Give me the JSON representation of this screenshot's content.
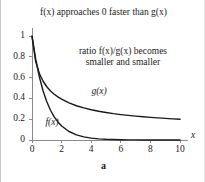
{
  "figure": {
    "caption": "a",
    "width": 205,
    "height": 182,
    "background": "#ffffff",
    "curve_color": "#1a1a1a",
    "axis_color": "#8a8a8a"
  },
  "chart_data": {
    "type": "line",
    "title": "f(x) approaches 0 faster than g(x)",
    "xlabel": "x",
    "ylabel": "",
    "xlim": [
      0,
      10.4
    ],
    "ylim": [
      0,
      1.06
    ],
    "grid": false,
    "legend": "inline-curve-labels",
    "xticks": [
      0,
      2,
      4,
      6,
      8,
      10
    ],
    "xticklabels": [
      "0",
      "2",
      "4",
      "6",
      "8",
      "10"
    ],
    "yticks": [
      0,
      0.2,
      0.4,
      0.6,
      0.8,
      1
    ],
    "yticklabels": [
      "0",
      "0.2",
      "0.4",
      "0.6",
      "0.8",
      "1"
    ],
    "annotations": [
      {
        "name": "ratio-note",
        "line1": "ratio f(x)/g(x) becomes",
        "line2": "smaller and smaller"
      }
    ],
    "series": [
      {
        "name": "f(x)",
        "label": "f(x)",
        "label_x": 1.45,
        "label_y": 0.165,
        "x": [
          0,
          0.25,
          0.5,
          0.75,
          1,
          1.25,
          1.5,
          1.75,
          2,
          2.5,
          3,
          3.5,
          4,
          4.5,
          5,
          5.5,
          6,
          6.5,
          7,
          7.5,
          8,
          8.5,
          9,
          9.5,
          10
        ],
        "values": [
          1,
          0.779,
          0.607,
          0.472,
          0.368,
          0.287,
          0.223,
          0.174,
          0.135,
          0.082,
          0.05,
          0.03,
          0.018,
          0.011,
          0.0067,
          0.0041,
          0.0025,
          0.0015,
          0.0009,
          0.00055,
          0.00034,
          0.0002,
          0.00012,
          7e-05,
          4.5e-05
        ]
      },
      {
        "name": "g(x)",
        "label": "g(x)",
        "label_x": 4.55,
        "label_y": 0.465,
        "x": [
          0,
          0.25,
          0.5,
          0.75,
          1,
          1.25,
          1.5,
          1.75,
          2,
          2.5,
          3,
          3.5,
          4,
          4.5,
          5,
          5.5,
          6,
          6.5,
          7,
          7.5,
          8,
          8.5,
          9,
          9.5,
          10
        ],
        "values": [
          1,
          0.756,
          0.64,
          0.566,
          0.513,
          0.473,
          0.441,
          0.415,
          0.393,
          0.357,
          0.33,
          0.309,
          0.292,
          0.277,
          0.265,
          0.254,
          0.245,
          0.237,
          0.23,
          0.224,
          0.218,
          0.213,
          0.208,
          0.204,
          0.2
        ]
      }
    ]
  }
}
